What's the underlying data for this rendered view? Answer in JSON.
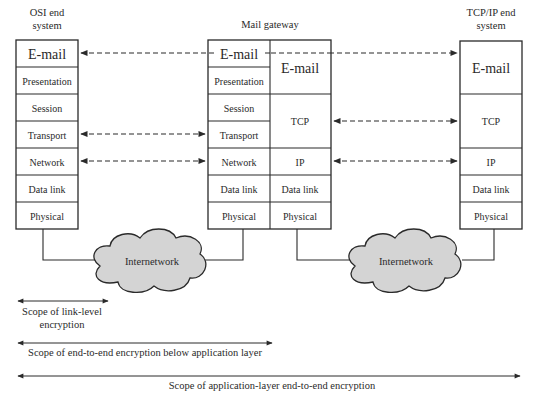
{
  "diagram": {
    "nodes": {
      "osi": {
        "title_line1": "OSI end",
        "title_line2": "system",
        "layers": [
          "E-mail",
          "Presentation",
          "Session",
          "Transport",
          "Network",
          "Data link",
          "Physical"
        ]
      },
      "gateway": {
        "title": "Mail gateway",
        "left_layers": [
          "E-mail",
          "Presentation",
          "Session",
          "Transport",
          "Network",
          "Data link",
          "Physical"
        ],
        "right_layers": [
          "E-mail",
          "TCP",
          "IP",
          "Data link",
          "Physical"
        ]
      },
      "tcpip": {
        "title_line1": "TCP/IP end",
        "title_line2": "system",
        "layers": [
          "E-mail",
          "TCP",
          "IP",
          "Data link",
          "Physical"
        ]
      }
    },
    "clouds": [
      {
        "label": "Internetwork"
      },
      {
        "label": "Internetwork"
      }
    ],
    "scopes": [
      {
        "line1": "Scope of link-level",
        "line2": "encryption"
      },
      {
        "line1": "Scope of end-to-end encryption below application layer"
      },
      {
        "line1": "Scope of application-layer end-to-end encryption"
      }
    ],
    "colors": {
      "line": "#2a2a2a",
      "cloud_fill": "#d4d4d4",
      "background": "#ffffff"
    }
  }
}
